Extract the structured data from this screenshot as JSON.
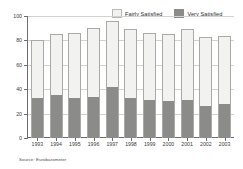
{
  "legend": {
    "position": "top-right",
    "items": [
      {
        "label": "Fairly Satisfied",
        "swatch": "light-gray-swatch",
        "color": "#f2f2f0"
      },
      {
        "label": "Very Satisfied",
        "swatch": "dark-gray-swatch",
        "color": "#8b8b89"
      }
    ]
  },
  "source_note": "Source: Eurobarometer",
  "chart_data": {
    "type": "bar",
    "stacked": true,
    "title": "",
    "subtitle": "",
    "xlabel": "",
    "ylabel": "",
    "ylim": [
      0,
      100
    ],
    "yticks": [
      0,
      20,
      40,
      60,
      80,
      100
    ],
    "ytick_labels": [
      "0",
      "20",
      "40",
      "60",
      "80",
      "100"
    ],
    "grid": true,
    "legend_position": "top-right",
    "categories": [
      "1993",
      "1994",
      "1995",
      "1996",
      "1997",
      "1998",
      "1999",
      "2000",
      "2001",
      "2002",
      "2003"
    ],
    "series": [
      {
        "name": "Very Satisfied",
        "color": "#8b8b89",
        "values": [
          33,
          35,
          33,
          34,
          42,
          33,
          31,
          30,
          31,
          26,
          28
        ]
      },
      {
        "name": "Fairly Satisfied",
        "color": "#f2f2f0",
        "values": [
          47,
          50,
          53,
          56,
          54,
          56,
          55,
          55,
          58,
          57,
          56
        ]
      }
    ],
    "totals": [
      80,
      85,
      86,
      90,
      96,
      89,
      86,
      85,
      89,
      83,
      84
    ],
    "annotations": []
  }
}
